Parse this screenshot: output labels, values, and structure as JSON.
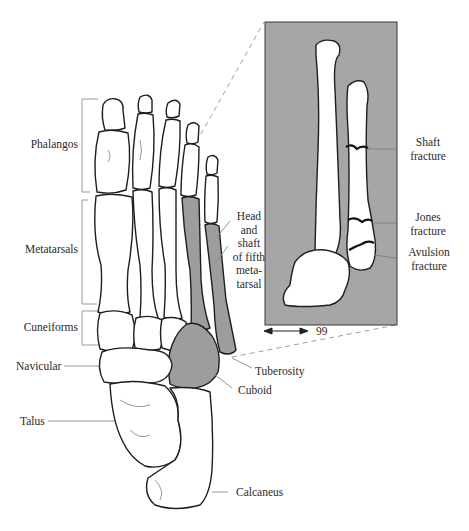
{
  "figure": {
    "colors": {
      "bone_outline": "#1e1e1e",
      "bone_fill": "#ffffff",
      "highlight_fill": "#9d9d9d",
      "inset_background": "#a6a6a6",
      "leader_line": "#8a8a8a",
      "label_text": "#2a2a2a"
    }
  },
  "labels": {
    "left": [
      {
        "id": "phalanges",
        "text": "Phalangos"
      },
      {
        "id": "metatarsals",
        "text": "Metatarsals"
      },
      {
        "id": "cuneiforms",
        "text": "Cuneiforms"
      },
      {
        "id": "navicular",
        "text": "Navicular"
      },
      {
        "id": "talus",
        "text": "Talus"
      }
    ],
    "right": [
      {
        "id": "fifth-metatarsal",
        "lines": [
          "Head",
          "and",
          "shaft",
          "of fifth",
          "meta-",
          "tarsal"
        ]
      },
      {
        "id": "tuberosity",
        "text": "Tuberosity"
      },
      {
        "id": "cuboid",
        "text": "Cuboid"
      },
      {
        "id": "calcaneus",
        "text": "Calcaneus"
      }
    ]
  },
  "inset": {
    "labels": [
      {
        "id": "shaft-fracture",
        "lines": [
          "Shaft",
          "fracture"
        ]
      },
      {
        "id": "jones-fracture",
        "lines": [
          "Jones",
          "fracture"
        ]
      },
      {
        "id": "avulsion-fracture",
        "lines": [
          "Avulsion",
          "fracture"
        ]
      }
    ],
    "scale_label": "99"
  }
}
